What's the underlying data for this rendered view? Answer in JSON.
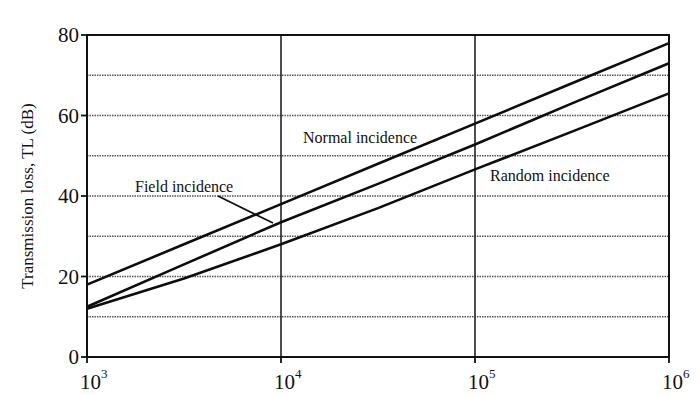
{
  "chart_data": {
    "type": "line",
    "title": "",
    "xlabel": "",
    "ylabel": "Transmission loss, TL  (dB)",
    "xscale": "log",
    "xlim": [
      1000,
      1000000
    ],
    "ylim": [
      0,
      80
    ],
    "x_ticks": [
      {
        "base": "10",
        "exp": "3",
        "value": 1000
      },
      {
        "base": "10",
        "exp": "4",
        "value": 10000
      },
      {
        "base": "10",
        "exp": "5",
        "value": 100000
      },
      {
        "base": "10",
        "exp": "6",
        "value": 1000000
      }
    ],
    "y_ticks": [
      0,
      20,
      40,
      60,
      80
    ],
    "y_gridlines": [
      10,
      20,
      30,
      40,
      50,
      60,
      70
    ],
    "grid": true,
    "legend": "inline annotations",
    "x": [
      1000,
      3162,
      10000,
      31623,
      100000,
      316228,
      1000000
    ],
    "series": [
      {
        "name": "Normal incidence",
        "values": [
          18,
          28,
          38,
          48,
          58,
          68,
          78
        ]
      },
      {
        "name": "Field incidence",
        "values": [
          12.5,
          23,
          33.5,
          43,
          52.8,
          63,
          73
        ]
      },
      {
        "name": "Random incidence",
        "values": [
          12,
          19.5,
          28,
          37,
          46.6,
          56,
          65.5
        ]
      }
    ],
    "annotations": [
      {
        "text": "Normal incidence",
        "x_px": 303,
        "y_px": 143,
        "target": "Normal incidence"
      },
      {
        "text": "Field incidence",
        "x_px": 135,
        "y_px": 192,
        "target": "Field incidence"
      },
      {
        "text": "Random incidence",
        "x_px": 490,
        "y_px": 180,
        "target": "Random incidence"
      }
    ]
  },
  "labels": {
    "ylabel": "Transmission loss, TL  (dB)",
    "normal": "Normal incidence",
    "field": "Field incidence",
    "random": "Random incidence"
  }
}
